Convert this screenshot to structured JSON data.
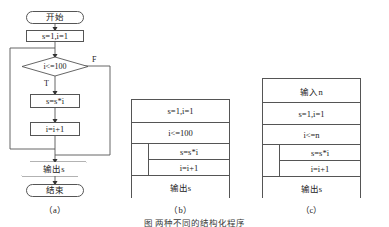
{
  "figure": {
    "caption": "图     两种不同的结构化程序"
  },
  "flowchart": {
    "caption": "（a）",
    "nodes": {
      "start": "开始",
      "init": "s=1,i=1",
      "condition": "i<=100",
      "multiply": "s=s*i",
      "increment": "i=i+1",
      "output": "输出s",
      "end": "结束"
    },
    "branches": {
      "true_label": "T",
      "false_label": "F"
    }
  },
  "ns_b": {
    "caption": "（b）",
    "rows": [
      "s=1,i=1",
      "i<=100"
    ],
    "nested": [
      "s=s*i",
      "i=i+1"
    ],
    "footer": "输出s"
  },
  "ns_c": {
    "caption": "（c）",
    "rows": [
      "输入n",
      "s=1,i=1",
      "i<=n"
    ],
    "nested": [
      "s=s*i",
      "i=i+1"
    ],
    "footer": "输出s"
  },
  "style": {
    "line_color": "#555555",
    "text_color": "#1a1a1a",
    "background": "#ffffff"
  }
}
